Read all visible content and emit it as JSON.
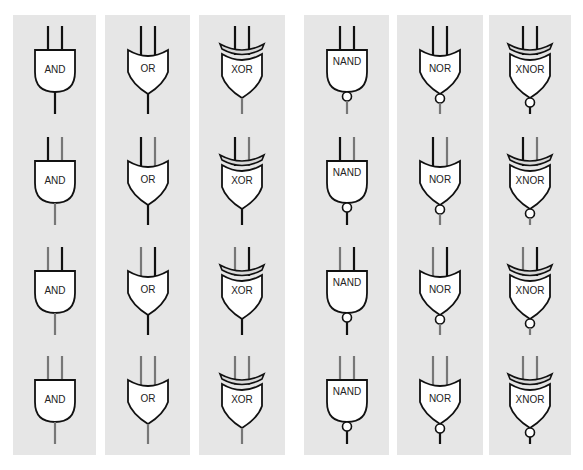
{
  "colors": {
    "panel_bg": "#e6e6e6",
    "page_bg": "#ffffff",
    "high_wire": "#111111",
    "low_wire": "#777777",
    "gate_fill": "#ffffff",
    "gate_stroke": "#111111",
    "xor_band": "#d9d9d9"
  },
  "columns": [
    {
      "gate": "AND",
      "label": "AND",
      "shape": "and",
      "bubble": false,
      "xor": false,
      "x": 13,
      "w": 83
    },
    {
      "gate": "OR",
      "label": "OR",
      "shape": "or",
      "bubble": false,
      "xor": false,
      "x": 105,
      "w": 85
    },
    {
      "gate": "XOR",
      "label": "XOR",
      "shape": "or",
      "bubble": false,
      "xor": true,
      "x": 199,
      "w": 86
    },
    {
      "gate": "NAND",
      "label": "NAND",
      "shape": "and",
      "bubble": true,
      "xor": false,
      "x": 304,
      "w": 85
    },
    {
      "gate": "NOR",
      "label": "NOR",
      "shape": "or",
      "bubble": true,
      "xor": false,
      "x": 397,
      "w": 86
    },
    {
      "gate": "XNOR",
      "label": "XNOR",
      "shape": "or",
      "bubble": true,
      "xor": true,
      "x": 489,
      "w": 82
    }
  ],
  "rows": [
    {
      "inputs": [
        1,
        1
      ],
      "y": 20
    },
    {
      "inputs": [
        1,
        0
      ],
      "y": 131
    },
    {
      "inputs": [
        0,
        1
      ],
      "y": 241
    },
    {
      "inputs": [
        0,
        0
      ],
      "y": 350
    }
  ],
  "outputs": {
    "AND": [
      1,
      0,
      0,
      0
    ],
    "OR": [
      1,
      1,
      1,
      0
    ],
    "XOR": [
      0,
      1,
      1,
      0
    ],
    "NAND": [
      0,
      1,
      1,
      1
    ],
    "NOR": [
      0,
      0,
      0,
      1
    ],
    "XNOR": [
      1,
      0,
      0,
      1
    ]
  }
}
